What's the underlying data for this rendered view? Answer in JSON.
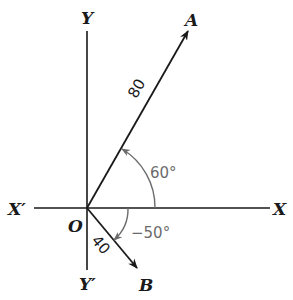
{
  "diagram": {
    "type": "vector-angle-diagram",
    "axes": {
      "x_positive": "X",
      "x_negative": "X′",
      "y_positive": "Y",
      "y_negative": "Y′",
      "origin": "O"
    },
    "vectors": [
      {
        "name": "A",
        "magnitude": "80",
        "angle_label": "60°",
        "angle_deg": 60
      },
      {
        "name": "B",
        "magnitude": "40",
        "angle_label": "−50°",
        "angle_deg": -50
      }
    ],
    "colors": {
      "line": "#1a1a1a",
      "angle_arc": "#6b6b6b"
    }
  }
}
